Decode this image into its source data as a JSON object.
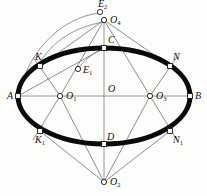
{
  "figure": {
    "colors": {
      "ellipse_stroke": "#0a0a0a",
      "construction_line": "#6e6e6e",
      "arc_line": "#7a7a7a",
      "axis_line": "#8a8a8a",
      "marker_fill_open": "#ffffff",
      "marker_fill_solid": "#ffffff",
      "marker_stroke": "#111111",
      "label_color": "#111111",
      "background": "#fdfdfb"
    },
    "ellipse": {
      "cx": 104,
      "cy": 96,
      "rx": 86,
      "ry": 48,
      "stroke_width": 5
    },
    "points": [
      {
        "id": "A",
        "label": "A",
        "sub": "",
        "x": 18,
        "y": 96,
        "marker": "square",
        "label_dx": -11,
        "label_dy": -5
      },
      {
        "id": "B",
        "label": "B",
        "sub": "",
        "x": 190,
        "y": 96,
        "marker": "square",
        "label_dx": 5,
        "label_dy": -5
      },
      {
        "id": "C",
        "label": "C",
        "sub": "",
        "x": 104,
        "y": 48,
        "marker": "square",
        "label_dx": 4,
        "label_dy": -13
      },
      {
        "id": "D",
        "label": "D",
        "sub": "",
        "x": 104,
        "y": 144,
        "marker": "square",
        "label_dx": 3,
        "label_dy": -12
      },
      {
        "id": "O",
        "label": "O",
        "sub": "",
        "x": 104,
        "y": 96,
        "marker": "none",
        "label_dx": 4,
        "label_dy": -12
      },
      {
        "id": "O1",
        "label": "O",
        "sub": "1",
        "x": 60,
        "y": 96,
        "marker": "circle",
        "label_dx": 6,
        "label_dy": -5
      },
      {
        "id": "O2",
        "label": "O",
        "sub": "2",
        "x": 104,
        "y": 182,
        "marker": "circle",
        "label_dx": 6,
        "label_dy": -5
      },
      {
        "id": "O3",
        "label": "O",
        "sub": "3",
        "x": 150,
        "y": 96,
        "marker": "circle",
        "label_dx": 6,
        "label_dy": -5
      },
      {
        "id": "O4",
        "label": "O",
        "sub": "4",
        "x": 104,
        "y": 20,
        "marker": "circle",
        "label_dx": 6,
        "label_dy": -5
      },
      {
        "id": "K",
        "label": "K",
        "sub": "",
        "x": 40,
        "y": 66,
        "marker": "square",
        "label_dx": -5,
        "label_dy": -14
      },
      {
        "id": "K1",
        "label": "K",
        "sub": "1",
        "x": 40,
        "y": 131,
        "marker": "square",
        "label_dx": -5,
        "label_dy": 4
      },
      {
        "id": "N",
        "label": "N",
        "sub": "",
        "x": 170,
        "y": 66,
        "marker": "square",
        "label_dx": 3,
        "label_dy": -14
      },
      {
        "id": "N1",
        "label": "N",
        "sub": "1",
        "x": 170,
        "y": 131,
        "marker": "square",
        "label_dx": 3,
        "label_dy": 4
      },
      {
        "id": "E1",
        "label": "E",
        "sub": "1",
        "x": 78,
        "y": 69,
        "marker": "circle",
        "label_dx": 5,
        "label_dy": -4
      },
      {
        "id": "E2",
        "label": "E",
        "sub": "2",
        "x": 100,
        "y": 12,
        "marker": "circle",
        "label_dx": -2,
        "label_dy": -13
      }
    ],
    "axes": [
      {
        "name": "major-axis-AB",
        "x1": 18,
        "y1": 96,
        "x2": 190,
        "y2": 96
      },
      {
        "name": "minor-axis-CD",
        "x1": 104,
        "y1": 20,
        "x2": 104,
        "y2": 182
      }
    ],
    "construction_lines": [
      {
        "name": "O4-to-K",
        "x1": 104,
        "y1": 20,
        "x2": 40,
        "y2": 66
      },
      {
        "name": "O4-to-N",
        "x1": 104,
        "y1": 20,
        "x2": 170,
        "y2": 66
      },
      {
        "name": "O4-to-O1",
        "x1": 104,
        "y1": 20,
        "x2": 60,
        "y2": 96
      },
      {
        "name": "O4-to-O3",
        "x1": 104,
        "y1": 20,
        "x2": 150,
        "y2": 96
      },
      {
        "name": "O2-to-K1",
        "x1": 104,
        "y1": 182,
        "x2": 40,
        "y2": 131
      },
      {
        "name": "O2-to-N1",
        "x1": 104,
        "y1": 182,
        "x2": 170,
        "y2": 131
      },
      {
        "name": "O2-to-O1",
        "x1": 104,
        "y1": 182,
        "x2": 60,
        "y2": 96
      },
      {
        "name": "O2-to-O3",
        "x1": 104,
        "y1": 182,
        "x2": 150,
        "y2": 96
      },
      {
        "name": "A-to-E1-C",
        "x1": 18,
        "y1": 96,
        "x2": 104,
        "y2": 48
      },
      {
        "name": "O1-to-K-ext",
        "x1": 60,
        "y1": 96,
        "x2": 33,
        "y2": 57
      },
      {
        "name": "O1-to-K1-ext",
        "x1": 60,
        "y1": 96,
        "x2": 33,
        "y2": 140
      },
      {
        "name": "O3-to-N-ext",
        "x1": 150,
        "y1": 96,
        "x2": 177,
        "y2": 57
      },
      {
        "name": "O3-to-N1-ext",
        "x1": 150,
        "y1": 96,
        "x2": 177,
        "y2": 140
      }
    ],
    "arcs": [
      {
        "name": "arc-E2-to-A",
        "d": "M 100 13 C 62 17 30 50 20 90"
      },
      {
        "name": "arc-O4-to-K",
        "d": "M 104 22 C 72 27 48 45 37 68"
      },
      {
        "name": "arc-C-to-E1",
        "d": "M 104 49 C 94 52 84 60 78 69"
      }
    ]
  }
}
